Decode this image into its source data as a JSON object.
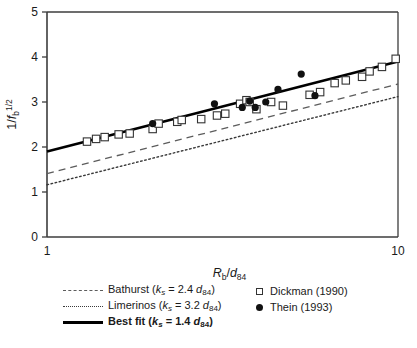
{
  "chart_data": {
    "type": "scatter",
    "title": "",
    "xlabel": "Rb/d84",
    "xlabel_parts": {
      "main1": "R",
      "sub1": "b",
      "slash": "/",
      "main2": "d",
      "sub2": "84"
    },
    "ylabel": "1/fb^1/2",
    "ylabel_parts": {
      "pre": "1/",
      "main": "f",
      "sub": "b",
      "sup": "1/2"
    },
    "x_scale": "log",
    "y_scale": "linear",
    "xlim": [
      1,
      10
    ],
    "ylim": [
      0,
      5
    ],
    "xticks": [
      "1",
      "10"
    ],
    "yticks": [
      "0",
      "1",
      "2",
      "3",
      "4",
      "5"
    ],
    "grid": false,
    "legend_position": "below-plot",
    "series": [
      {
        "name": "Dickman (1990)",
        "marker": "open-square",
        "points": [
          {
            "x": 1.3,
            "y": 2.12
          },
          {
            "x": 1.38,
            "y": 2.18
          },
          {
            "x": 1.46,
            "y": 2.22
          },
          {
            "x": 1.6,
            "y": 2.28
          },
          {
            "x": 1.72,
            "y": 2.3
          },
          {
            "x": 2.0,
            "y": 2.4
          },
          {
            "x": 2.08,
            "y": 2.52
          },
          {
            "x": 2.35,
            "y": 2.56
          },
          {
            "x": 2.42,
            "y": 2.6
          },
          {
            "x": 2.75,
            "y": 2.62
          },
          {
            "x": 3.05,
            "y": 2.7
          },
          {
            "x": 3.22,
            "y": 2.74
          },
          {
            "x": 3.55,
            "y": 2.96
          },
          {
            "x": 3.7,
            "y": 3.04
          },
          {
            "x": 3.78,
            "y": 3.0
          },
          {
            "x": 3.95,
            "y": 2.84
          },
          {
            "x": 4.35,
            "y": 3.0
          },
          {
            "x": 4.7,
            "y": 2.92
          },
          {
            "x": 5.6,
            "y": 3.16
          },
          {
            "x": 6.0,
            "y": 3.22
          },
          {
            "x": 6.6,
            "y": 3.42
          },
          {
            "x": 7.1,
            "y": 3.48
          },
          {
            "x": 7.9,
            "y": 3.56
          },
          {
            "x": 8.3,
            "y": 3.68
          },
          {
            "x": 9.0,
            "y": 3.78
          },
          {
            "x": 9.85,
            "y": 3.96
          }
        ]
      },
      {
        "name": "Thein (1993)",
        "marker": "filled-circle",
        "points": [
          {
            "x": 2.0,
            "y": 2.52
          },
          {
            "x": 3.0,
            "y": 2.96
          },
          {
            "x": 3.6,
            "y": 2.88
          },
          {
            "x": 3.78,
            "y": 3.02
          },
          {
            "x": 3.92,
            "y": 2.88
          },
          {
            "x": 4.2,
            "y": 3.0
          },
          {
            "x": 4.55,
            "y": 3.28
          },
          {
            "x": 5.3,
            "y": 3.62
          },
          {
            "x": 5.8,
            "y": 3.14
          }
        ]
      }
    ],
    "lines": [
      {
        "name": "Bathurst (ks = 2.4 d84)",
        "label_parts": {
          "author": "Bathurst",
          "k": "k",
          "ksub": "s",
          "eq": " = ",
          "coef": "2.4 ",
          "d": "d",
          "dsub": "84"
        },
        "style": "dashed",
        "color": "#5c5c5c",
        "endpoints": [
          {
            "x": 1,
            "y": 1.41
          },
          {
            "x": 10,
            "y": 3.4
          }
        ]
      },
      {
        "name": "Limerinos (ks = 3.2 d84)",
        "label_parts": {
          "author": "Limerinos",
          "k": "k",
          "ksub": "s",
          "eq": " = ",
          "coef": "3.2 ",
          "d": "d",
          "dsub": "84"
        },
        "style": "dotted",
        "color": "#3a3a3a",
        "endpoints": [
          {
            "x": 1,
            "y": 1.16
          },
          {
            "x": 10,
            "y": 3.12
          }
        ]
      },
      {
        "name": "Best fit (ks = 1.4 d84)",
        "label_parts": {
          "author": "Best fit",
          "k": "k",
          "ksub": "s",
          "eq": " = ",
          "coef": "1.4 ",
          "d": "d",
          "dsub": "84"
        },
        "style": "solid",
        "color": "#000000",
        "endpoints": [
          {
            "x": 1,
            "y": 1.9
          },
          {
            "x": 10,
            "y": 3.9
          }
        ]
      }
    ]
  },
  "legend": {
    "left_column": [
      {
        "label": "Bathurst",
        "paren_open": "(",
        "k": "k",
        "ksub": "s",
        "eq": " = ",
        "value": "2.4 ",
        "d": "d",
        "dsub": "84",
        "paren_close": ")",
        "swatch": "dashed-line-swatch"
      },
      {
        "label": "Limerinos",
        "paren_open": "(",
        "k": "k",
        "ksub": "s",
        "eq": " = ",
        "value": "3.2 ",
        "d": "d",
        "dsub": "84",
        "paren_close": ")",
        "swatch": "dotted-line-swatch"
      },
      {
        "label": "Best fit",
        "paren_open": "(",
        "k": "k",
        "ksub": "s",
        "eq": " = ",
        "value": "1.4 ",
        "d": "d",
        "dsub": "84",
        "paren_close": ")",
        "swatch": "solid-line-swatch"
      }
    ],
    "right_column": [
      {
        "label": "Dickman (1990)",
        "swatch": "open-square-marker"
      },
      {
        "label": "Thein (1993)",
        "swatch": "filled-circle-marker"
      }
    ]
  },
  "axes": {
    "y_tick_labels": [
      "5",
      "4",
      "3",
      "2",
      "1",
      "0"
    ],
    "x_tick_labels": [
      "1",
      "10"
    ]
  },
  "colors": {
    "axis": "#3d3d3d",
    "bestfit": "#000000",
    "bathurst": "#5c5c5c",
    "limerinos": "#3a3a3a",
    "marker_square": "#333333",
    "marker_circle": "#111111",
    "background": "#ffffff"
  }
}
